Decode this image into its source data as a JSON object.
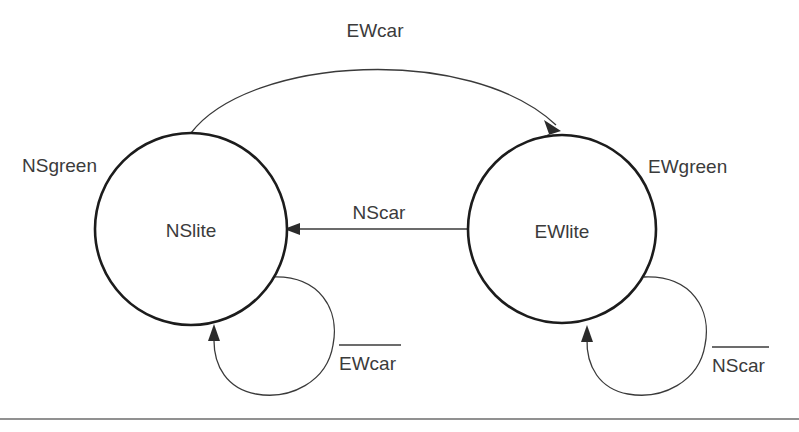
{
  "diagram": {
    "type": "finite-state-machine",
    "background_color": "#ffffff",
    "stroke_color": "#1c1c1c",
    "text_color": "#3b3b3b",
    "states": [
      {
        "id": "nslite",
        "name": "NSlite",
        "output_label": "NSgreen",
        "cx": 191,
        "cy": 229,
        "r": 96
      },
      {
        "id": "ewlite",
        "name": "EWlite",
        "output_label": "EWgreen",
        "cx": 562,
        "cy": 229,
        "r": 94
      }
    ],
    "transitions": [
      {
        "id": "ns-to-ew",
        "label": "EWcar",
        "overline": false,
        "from": "nslite",
        "to": "ewlite",
        "shape": "arc-over"
      },
      {
        "id": "ew-to-ns",
        "label": "NScar",
        "overline": false,
        "from": "ewlite",
        "to": "nslite",
        "shape": "straight"
      },
      {
        "id": "ns-self",
        "label": "EWcar",
        "overline": true,
        "from": "nslite",
        "to": "nslite",
        "shape": "self-loop"
      },
      {
        "id": "ew-self",
        "label": "NScar",
        "overline": true,
        "from": "ewlite",
        "to": "ewlite",
        "shape": "self-loop"
      }
    ]
  }
}
